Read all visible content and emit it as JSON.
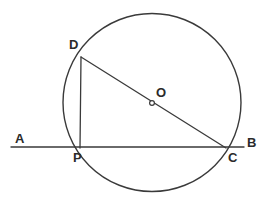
{
  "figure": {
    "kind": "circle-geometry-diagram",
    "width": 267,
    "height": 201,
    "background_color": "#ffffff",
    "stroke_color": "#3a3a3a",
    "label_color": "#2b2b2b"
  },
  "labels": {
    "a": "A",
    "b": "B",
    "c": "C",
    "d": "D",
    "o": "O",
    "p": "P"
  },
  "geometry": {
    "circle": {
      "name": "main-circle",
      "cx": 152,
      "cy": 102.5,
      "r": 89
    },
    "center_marker": {
      "name": "center-point-o",
      "cx": 152,
      "cy": 103,
      "r": 2.4
    },
    "secant_line_ab": {
      "name": "line-ab",
      "x1": 11,
      "y1": 147,
      "x2": 244,
      "y2": 147
    },
    "diameter_dc": {
      "name": "segment-dc",
      "x1": 81,
      "y1": 57,
      "x2": 226,
      "y2": 148
    },
    "chord_dp": {
      "name": "segment-dp",
      "x1": 81,
      "y1": 57,
      "x2": 80,
      "y2": 148
    }
  },
  "label_positions": {
    "a": {
      "left": 15,
      "top": 132
    },
    "b": {
      "left": 247,
      "top": 136
    },
    "c": {
      "left": 228,
      "top": 151
    },
    "d": {
      "left": 69,
      "top": 38
    },
    "o": {
      "left": 156,
      "top": 86
    },
    "p": {
      "left": 73,
      "top": 151
    }
  }
}
